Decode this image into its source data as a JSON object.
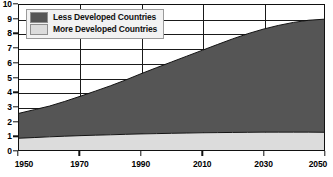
{
  "chart_data": {
    "type": "area",
    "stacked": true,
    "title": "",
    "subtitle": "",
    "xlabel": "",
    "ylabel": "",
    "xlim": [
      1950,
      2050
    ],
    "ylim": [
      0,
      10
    ],
    "grid": true,
    "legend_position": "top-left",
    "x_ticks": [
      "1950",
      "1970",
      "1990",
      "2010",
      "2030",
      "2050"
    ],
    "x_tick_values": [
      1950,
      1970,
      1990,
      2010,
      2030,
      2050
    ],
    "y_ticks": [
      "0",
      "1",
      "2",
      "3",
      "4",
      "5",
      "6",
      "7",
      "8",
      "9",
      "10"
    ],
    "y_tick_values": [
      0,
      1,
      2,
      3,
      4,
      5,
      6,
      7,
      8,
      9,
      10
    ],
    "x": [
      1950,
      1955,
      1960,
      1965,
      1970,
      1975,
      1980,
      1985,
      1990,
      1995,
      2000,
      2005,
      2010,
      2015,
      2020,
      2025,
      2030,
      2035,
      2040,
      2045,
      2050
    ],
    "series": [
      {
        "name": "More Developed Countries",
        "color": "#dcdcdc",
        "stack_order": 1,
        "values": [
          0.81,
          0.86,
          0.91,
          0.95,
          0.99,
          1.02,
          1.05,
          1.08,
          1.11,
          1.13,
          1.15,
          1.17,
          1.19,
          1.2,
          1.21,
          1.22,
          1.23,
          1.23,
          1.23,
          1.23,
          1.22
        ]
      },
      {
        "name": "Less Developed Countries",
        "color": "#555555",
        "stack_order": 2,
        "values": [
          1.72,
          1.92,
          2.12,
          2.4,
          2.71,
          3.04,
          3.38,
          3.75,
          4.15,
          4.54,
          4.92,
          5.3,
          5.68,
          6.07,
          6.45,
          6.8,
          7.1,
          7.36,
          7.57,
          7.72,
          7.8
        ]
      }
    ],
    "totals": [
      2.53,
      2.78,
      3.03,
      3.35,
      3.7,
      4.06,
      4.43,
      4.83,
      5.26,
      5.67,
      6.07,
      6.47,
      6.87,
      7.27,
      7.66,
      8.02,
      8.33,
      8.59,
      8.8,
      8.95,
      9.02
    ]
  },
  "legend": {
    "entries": [
      {
        "label": "Less Developed Countries",
        "color": "#555555"
      },
      {
        "label": "More Developed Countries",
        "color": "#dcdcdc"
      }
    ]
  },
  "colors": {
    "less_developed": "#555555",
    "more_developed": "#dcdcdc",
    "axis": "#111111",
    "grid": "#1a1a1a",
    "background": "#ffffff",
    "legend_background": "#f2f2f2",
    "legend_border": "#9a9a9a"
  }
}
